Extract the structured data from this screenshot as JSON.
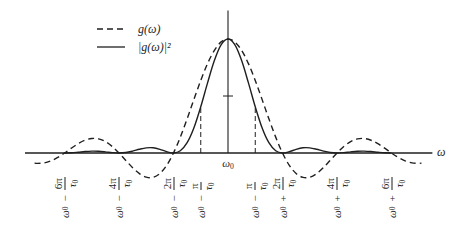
{
  "chart_data": {
    "type": "line",
    "title": "",
    "xlabel": "ω",
    "ylabel": "",
    "x_unit": "π/τ0 offset from ω0",
    "xlim": [
      -7.45,
      7.5
    ],
    "ylim": [
      -0.25,
      1.25
    ],
    "grid": false,
    "legend_position": "upper left",
    "legend": [
      {
        "name": "g(ω)",
        "style": "dashed"
      },
      {
        "name": "|g(ω)|²",
        "style": "solid"
      }
    ],
    "center_tick_label": {
      "text": "ω0",
      "base": "ω",
      "sub": "0"
    },
    "x_tick_labels": [
      {
        "k": -6,
        "text": "ω0 − 6π/τ0",
        "base": "ω",
        "base_sub": "0",
        "op": "−",
        "num": "6π",
        "den": "τ",
        "den_sub": "0"
      },
      {
        "k": -4,
        "text": "ω0 − 4π/τ0",
        "base": "ω",
        "base_sub": "0",
        "op": "−",
        "num": "4π",
        "den": "τ",
        "den_sub": "0"
      },
      {
        "k": -2,
        "text": "ω0 − 2π/τ0",
        "base": "ω",
        "base_sub": "0",
        "op": "−",
        "num": "2π",
        "den": "τ",
        "den_sub": "0"
      },
      {
        "k": -1,
        "text": "ω0 − π/τ0",
        "base": "ω",
        "base_sub": "0",
        "op": "−",
        "num": "π",
        "den": "τ",
        "den_sub": "0"
      },
      {
        "k": 1,
        "text": "ω0 − π/τ0",
        "base": "ω",
        "base_sub": "0",
        "op": "−",
        "num": "π",
        "den": "τ",
        "den_sub": "0"
      },
      {
        "k": 2,
        "text": "ω0 + 2π/τ0",
        "base": "ω",
        "base_sub": "0",
        "op": "+",
        "num": "2π",
        "den": "τ",
        "den_sub": "0"
      },
      {
        "k": 4,
        "text": "ω0 + 4π/τ0",
        "base": "ω",
        "base_sub": "0",
        "op": "+",
        "num": "4π",
        "den": "τ",
        "den_sub": "0"
      },
      {
        "k": 6,
        "text": "ω0 + 6π/τ0",
        "base": "ω",
        "base_sub": "0",
        "op": "+",
        "num": "6π",
        "den": "τ",
        "den_sub": "0"
      }
    ],
    "annotations": {
      "half_max_marker": 0.5,
      "dashed_guides": [
        {
          "x": -1,
          "top": 0.4053
        },
        {
          "x": 1,
          "top": 0.4053
        }
      ]
    },
    "series": [
      {
        "name": "g(ω)",
        "style": "dashed",
        "x": [
          -7.1,
          -7,
          -6.75,
          -6.5,
          -6.25,
          -6,
          -5.75,
          -5.5,
          -5.25,
          -5,
          -4.75,
          -4.5,
          -4.25,
          -4,
          -3.75,
          -3.5,
          -3.25,
          -3,
          -2.75,
          -2.5,
          -2.25,
          -2,
          -1.75,
          -1.5,
          -1.25,
          -1,
          -0.75,
          -0.5,
          -0.25,
          0,
          0.25,
          0.5,
          0.75,
          1,
          1.25,
          1.5,
          1.75,
          2,
          2.25,
          2.5,
          2.75,
          3,
          3.25,
          3.5,
          3.75,
          4,
          4.25,
          4.5,
          4.75,
          5,
          5.25,
          5.5,
          5.75,
          6,
          6.25,
          6.5,
          6.75,
          7,
          7.1
        ],
        "values": [
          -0.0886,
          -0.0909,
          -0.0871,
          -0.0693,
          -0.039,
          0,
          0.0424,
          0.0818,
          0.112,
          0.1273,
          0.1238,
          0.1,
          0.0573,
          0,
          -0.065,
          -0.1286,
          -0.181,
          -0.2122,
          -0.2139,
          -0.1801,
          -0.1083,
          0,
          0.1392,
          0.3001,
          0.4705,
          0.6366,
          0.7842,
          0.9003,
          0.9745,
          1,
          0.9745,
          0.9003,
          0.7842,
          0.6366,
          0.4705,
          0.3001,
          0.1392,
          0,
          -0.1083,
          -0.1801,
          -0.2139,
          -0.2122,
          -0.181,
          -0.1286,
          -0.065,
          0,
          0.0573,
          0.1,
          0.1238,
          0.1273,
          0.112,
          0.0818,
          0.0424,
          0,
          -0.039,
          -0.0693,
          -0.0871,
          -0.0909,
          -0.0886
        ]
      },
      {
        "name": "|g(ω)|²",
        "style": "solid",
        "x": [
          -6,
          -5.75,
          -5.5,
          -5.25,
          -5,
          -4.75,
          -4.5,
          -4.25,
          -4,
          -3.75,
          -3.5,
          -3.25,
          -3,
          -2.75,
          -2.5,
          -2.25,
          -2,
          -1.75,
          -1.5,
          -1.25,
          -1,
          -0.75,
          -0.5,
          -0.25,
          0,
          0.25,
          0.5,
          0.75,
          1,
          1.25,
          1.5,
          1.75,
          2,
          2.25,
          2.5,
          2.75,
          3,
          3.25,
          3.5,
          3.75,
          4,
          4.25,
          4.5,
          4.75,
          5,
          5.25,
          5.5,
          5.75,
          6
        ],
        "values": [
          0,
          0.0018,
          0.0067,
          0.0125,
          0.0162,
          0.0153,
          0.01,
          0.0033,
          0,
          0.0042,
          0.0165,
          0.0328,
          0.045,
          0.0458,
          0.0324,
          0.0117,
          0,
          0.0194,
          0.0901,
          0.2214,
          0.4053,
          0.615,
          0.8106,
          0.9497,
          1,
          0.9497,
          0.8106,
          0.615,
          0.4053,
          0.2214,
          0.0901,
          0.0194,
          0,
          0.0117,
          0.0324,
          0.0458,
          0.045,
          0.0328,
          0.0165,
          0.0042,
          0,
          0.0033,
          0.01,
          0.0153,
          0.0162,
          0.0125,
          0.0067,
          0.0018,
          0
        ]
      }
    ],
    "colors": {
      "ink": "#1f1f1f",
      "background": "#ffffff"
    }
  }
}
